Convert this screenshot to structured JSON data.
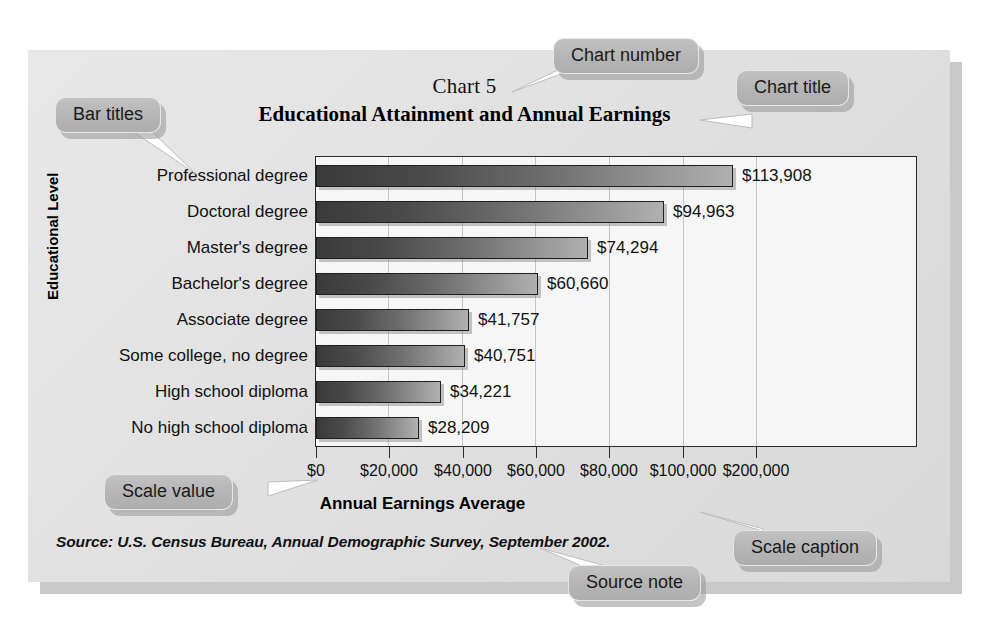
{
  "chart_data": {
    "type": "bar",
    "orientation": "horizontal",
    "number": "Chart 5",
    "title": "Educational Attainment and Annual Earnings",
    "categories": [
      "Professional degree",
      "Doctoral degree",
      "Master's degree",
      "Bachelor's degree",
      "Associate degree",
      "Some college, no degree",
      "High school diploma",
      "No high school diploma"
    ],
    "values": [
      113908,
      94963,
      74294,
      60660,
      41757,
      40751,
      34221,
      28209
    ],
    "value_labels": [
      "$113,908",
      "$94,963",
      "$74,294",
      "$60,660",
      "$41,757",
      "$40,751",
      "$34,221",
      "$28,209"
    ],
    "xlabel": "Annual Earnings Average",
    "ylabel": "Educational Level",
    "xticks": [
      0,
      20000,
      40000,
      60000,
      80000,
      100000,
      120000
    ],
    "xtick_labels": [
      "$0",
      "$20,000",
      "$40,000",
      "$60,000",
      "$80,000",
      "$100,000",
      "$200,000"
    ],
    "xlim": [
      0,
      165000
    ],
    "grid": "vertical",
    "legend": "none",
    "bar_gradient_from": "#3a3a3a",
    "bar_gradient_to": "#b0b0b0",
    "plot_background": "#f6f6f6",
    "panel_background": "#e4e4e4"
  },
  "source_note": "Source: U.S. Census Bureau, Annual Demographic Survey, September 2002.",
  "callouts": [
    {
      "label": "Chart number"
    },
    {
      "label": "Chart title"
    },
    {
      "label": "Bar titles"
    },
    {
      "label": "Scale value"
    },
    {
      "label": "Scale caption"
    },
    {
      "label": "Source note"
    }
  ]
}
